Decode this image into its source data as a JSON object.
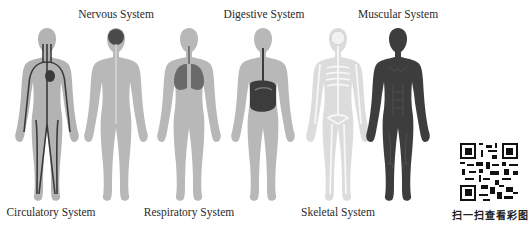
{
  "diagram": {
    "type": "human-body-systems",
    "figures": [
      {
        "id": "circulatory",
        "label": "Circulatory System",
        "label_position": "bottom",
        "body_color": "#b3b3b3",
        "detail_color": "#3a3a3a"
      },
      {
        "id": "nervous",
        "label": "Nervous System",
        "label_position": "top",
        "body_color": "#b8b8b8",
        "detail_color": "#4a4a4a"
      },
      {
        "id": "respiratory",
        "label": "Respiratory System",
        "label_position": "bottom",
        "body_color": "#b8b8b8",
        "detail_color": "#6a6a6a"
      },
      {
        "id": "digestive",
        "label": "Digestive System",
        "label_position": "top",
        "body_color": "#b8b8b8",
        "detail_color": "#3c3c3c"
      },
      {
        "id": "skeletal",
        "label": "Skeletal System",
        "label_position": "bottom",
        "body_color": "#dcdcdc",
        "detail_color": "#f4f4f4"
      },
      {
        "id": "muscular",
        "label": "Muscular System",
        "label_position": "top",
        "body_color": "#3d3d3d",
        "detail_color": "#2a2a2a"
      }
    ]
  },
  "qr": {
    "icon": "qr-code-icon",
    "caption": "扫一扫查看彩图"
  }
}
